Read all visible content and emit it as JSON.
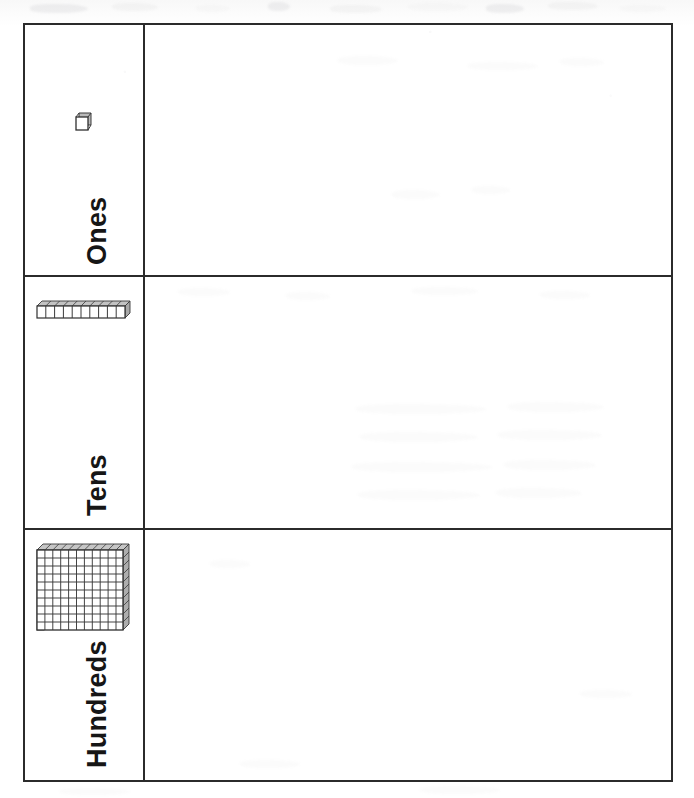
{
  "document": {
    "type": "place-value-chart-worksheet",
    "title": "Place Value Chart"
  },
  "chart": {
    "orientation": "rows-bottom-to-top",
    "column_headers": [
      "place-value-label",
      "work-area"
    ],
    "rows": [
      {
        "id": "ones",
        "label": "Ones",
        "block_icon": "unit-cube-icon",
        "block_name": "unit cube",
        "block_value": 1,
        "work_area_content": ""
      },
      {
        "id": "tens",
        "label": "Tens",
        "block_icon": "ten-rod-icon",
        "block_name": "ten rod",
        "block_value": 10,
        "block_segments": 10,
        "work_area_content": ""
      },
      {
        "id": "hundreds",
        "label": "Hundreds",
        "block_icon": "hundred-flat-icon",
        "block_name": "hundred flat",
        "block_value": 100,
        "block_grid": [
          10,
          10
        ],
        "work_area_content": ""
      }
    ]
  },
  "colors": {
    "border": "#2b2b2b",
    "text": "#161616",
    "block_line": "#3a3a3a",
    "block_shade": "#9a9a9a",
    "paper": "#ffffff"
  }
}
